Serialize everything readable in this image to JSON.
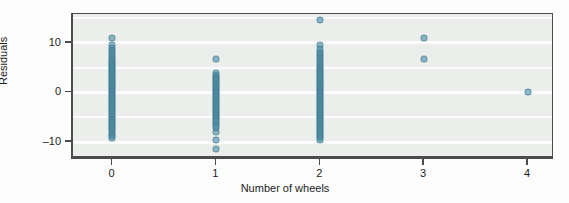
{
  "chart_data": {
    "type": "scatter",
    "title": "",
    "xlabel": "Number of wheels",
    "ylabel": "Residuals",
    "xlim": [
      -0.38,
      4.25
    ],
    "ylim": [
      -13.2,
      15.8
    ],
    "xticks": [
      0,
      1,
      2,
      3,
      4
    ],
    "xticklabels": [
      "0",
      "1",
      "2",
      "3",
      "4"
    ],
    "yticks": [
      -10,
      0,
      10
    ],
    "yticklabels": [
      "–10",
      "0",
      "10"
    ],
    "grid": "horizontal-white-major-minor",
    "legend": "none",
    "panel_background": "#eceeec",
    "point_color": "#4f8ea6",
    "point_opacity": 0.62,
    "series": [
      {
        "name": "residuals",
        "x": [
          0,
          0,
          0,
          0,
          0,
          0,
          0,
          0,
          0,
          0,
          0,
          0,
          0,
          0,
          0,
          0,
          0,
          0,
          0,
          0,
          0,
          0,
          0,
          0,
          0,
          0,
          0,
          0,
          0,
          0,
          0,
          0,
          0,
          0,
          0,
          0,
          0,
          0,
          0,
          0,
          0,
          0,
          0,
          0,
          0,
          0,
          0,
          0,
          0,
          0,
          0,
          0,
          0,
          0,
          0,
          0,
          0,
          0,
          0,
          0,
          1,
          1,
          1,
          1,
          1,
          1,
          1,
          1,
          1,
          1,
          1,
          1,
          1,
          1,
          1,
          1,
          1,
          1,
          1,
          1,
          1,
          1,
          1,
          1,
          1,
          1,
          1,
          1,
          1,
          1,
          1,
          1,
          1,
          1,
          1,
          1,
          1,
          1,
          1,
          1,
          2,
          2,
          2,
          2,
          2,
          2,
          2,
          2,
          2,
          2,
          2,
          2,
          2,
          2,
          2,
          2,
          2,
          2,
          2,
          2,
          2,
          2,
          2,
          2,
          2,
          2,
          2,
          2,
          2,
          2,
          2,
          2,
          2,
          2,
          2,
          2,
          2,
          2,
          2,
          2,
          2,
          2,
          2,
          2,
          2,
          2,
          2,
          2,
          2,
          2,
          2,
          2,
          2,
          2,
          2,
          2,
          2,
          2,
          2,
          2,
          3,
          3,
          4
        ],
        "y": [
          11.0,
          9.5,
          9.0,
          8.6,
          8.2,
          7.8,
          7.4,
          7.0,
          6.6,
          6.3,
          6.0,
          5.7,
          5.4,
          5.1,
          4.8,
          4.5,
          4.2,
          3.9,
          3.6,
          3.3,
          3.0,
          2.7,
          2.4,
          2.1,
          1.8,
          1.5,
          1.2,
          0.9,
          0.6,
          0.3,
          0.0,
          -0.3,
          -0.6,
          -0.9,
          -1.2,
          -1.5,
          -1.8,
          -2.1,
          -2.4,
          -2.7,
          -3.0,
          -3.3,
          -3.6,
          -3.9,
          -4.3,
          -4.7,
          -5.0,
          -5.3,
          -5.6,
          -5.9,
          -6.2,
          -6.5,
          -6.8,
          -7.1,
          -7.4,
          -7.7,
          -8.1,
          -8.5,
          -8.8,
          -9.1,
          6.7,
          4.0,
          3.6,
          3.2,
          2.9,
          2.6,
          2.3,
          2.0,
          1.7,
          1.4,
          1.1,
          0.8,
          0.5,
          0.2,
          -0.1,
          -0.4,
          -0.7,
          -1.0,
          -1.3,
          -1.6,
          -1.9,
          -2.2,
          -2.5,
          -2.8,
          -3.1,
          -3.4,
          -3.7,
          -4.0,
          -4.3,
          -4.6,
          -4.9,
          -5.2,
          -5.6,
          -6.0,
          -6.4,
          -6.8,
          -7.2,
          -8.0,
          -9.6,
          -11.4,
          14.5,
          9.5,
          8.8,
          8.2,
          7.7,
          7.3,
          6.9,
          6.5,
          6.1,
          5.7,
          5.3,
          5.0,
          4.7,
          4.4,
          4.1,
          3.8,
          3.5,
          3.2,
          2.9,
          2.6,
          2.3,
          2.0,
          1.7,
          1.4,
          1.1,
          0.8,
          0.5,
          0.2,
          -0.1,
          -0.4,
          -0.7,
          -1.0,
          -1.3,
          -1.6,
          -1.9,
          -2.2,
          -2.5,
          -2.8,
          -3.1,
          -3.4,
          -3.7,
          -4.0,
          -4.3,
          -4.6,
          -4.9,
          -5.2,
          -5.5,
          -5.8,
          -6.1,
          -6.4,
          -6.7,
          -7.0,
          -7.3,
          -7.6,
          -7.9,
          -8.2,
          -8.5,
          -8.8,
          -9.1,
          -9.5,
          11.0,
          6.7,
          0.0
        ]
      }
    ]
  }
}
